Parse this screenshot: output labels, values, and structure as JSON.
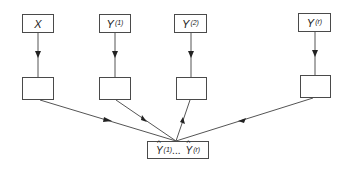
{
  "diagram": {
    "inputs": [
      {
        "id": "x",
        "base": "X",
        "sup": ""
      },
      {
        "id": "y1",
        "base": "Y",
        "sup": "(1)"
      },
      {
        "id": "y2",
        "base": "Y",
        "sup": "(2)"
      },
      {
        "id": "yr",
        "base": "Y",
        "sup": "(r)"
      }
    ],
    "intermediate_boxes": 4,
    "output": {
      "first_base": "Y",
      "first_sup": "(1)",
      "ellipsis": "...",
      "last_base": "Y",
      "last_sup": "(r)"
    },
    "colors": {
      "stroke": "#4a4a4a",
      "background": "#ffffff"
    }
  }
}
